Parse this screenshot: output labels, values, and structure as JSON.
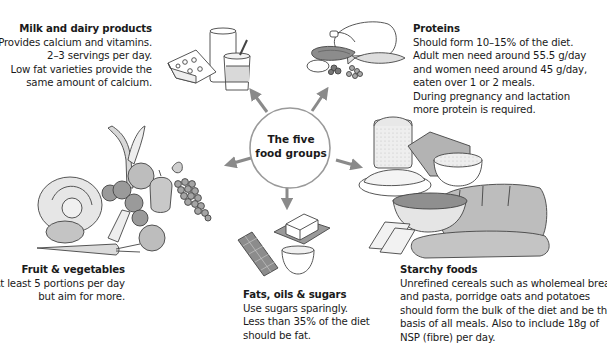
{
  "center": {
    "line1": "The five",
    "line2": "food groups"
  },
  "groups": {
    "dairy": {
      "title": "Milk and dairy products",
      "lines": [
        "Provides calcium and vitamins.",
        "2–3 servings per day.",
        "Low fat varieties provide the",
        "same amount of calcium."
      ],
      "icon": "dairy-illustration-icon"
    },
    "proteins": {
      "title": "Proteins",
      "lines": [
        "Should form 10–15% of the diet.",
        "Adult men need around 55.5 g/day",
        "and women need around 45 g/day,",
        "eaten over 1 or 2 meals.",
        "During pregnancy and lactation",
        "more protein is required."
      ],
      "icon": "protein-illustration-icon"
    },
    "fruit_veg": {
      "title": "Fruit & vegetables",
      "lines": [
        "At least 5 portions per day",
        "but aim for more."
      ],
      "icon": "fruit-vegetable-illustration-icon"
    },
    "fats": {
      "title": "Fats, oils & sugars",
      "lines": [
        "Use sugars sparingly.",
        "Less than 35% of the diet",
        "should be fat."
      ],
      "icon": "fats-sugars-illustration-icon"
    },
    "starchy": {
      "title": "Starchy foods",
      "lines": [
        "Unrefined cereals such as wholemeal bread",
        "and pasta, porridge oats and potatoes",
        "should form the bulk of the diet and be the",
        "basis of all meals. Also to include 18g of",
        "NSP (fibre) per day."
      ],
      "icon": "starchy-foods-illustration-icon"
    }
  },
  "colors": {
    "arrow": "#8a8a8a",
    "circle_stroke": "#8f8f8f",
    "outline": "#444444",
    "fill_light": "#e6e6e6",
    "fill_mid": "#bdbdbd",
    "fill_dark": "#9a9a9a"
  }
}
